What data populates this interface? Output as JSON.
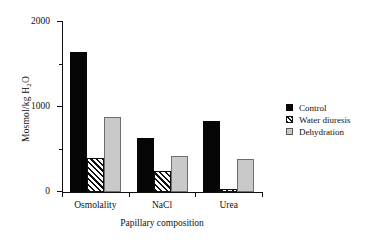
{
  "chart_data": {
    "type": "bar",
    "title": "",
    "xlabel": "Papillary composition",
    "ylabel": "Mosmol/kg H2O",
    "ylabel_prefix": "Mosmol/kg H",
    "ylabel_sub": "2",
    "ylabel_suffix": "O",
    "categories": [
      "Osmolality",
      "NaCl",
      "Urea"
    ],
    "series": [
      {
        "name": "Control",
        "values": [
          1650,
          640,
          840
        ],
        "color": "#050505",
        "fill": "solid"
      },
      {
        "name": "Water diuresis",
        "values": [
          400,
          250,
          40
        ],
        "color": "#111111",
        "fill": "hatch"
      },
      {
        "name": "Dehydration",
        "values": [
          880,
          420,
          390
        ],
        "color": "#c9c9c9",
        "fill": "light-gray"
      }
    ],
    "ylim": [
      0,
      2000
    ],
    "ytick_major": [
      0,
      1000,
      2000
    ],
    "ytick_minor": [
      500,
      1500
    ],
    "ytick_labels": [
      "0",
      "1000",
      "2000"
    ],
    "grid": false,
    "legend_position": "right"
  },
  "axis": {
    "y_tick_0": "0",
    "y_tick_1000": "1000",
    "y_tick_2000": "2000"
  },
  "legend": {
    "items": [
      {
        "label": "Control"
      },
      {
        "label": "Water diuresis"
      },
      {
        "label": "Dehydration"
      }
    ]
  }
}
